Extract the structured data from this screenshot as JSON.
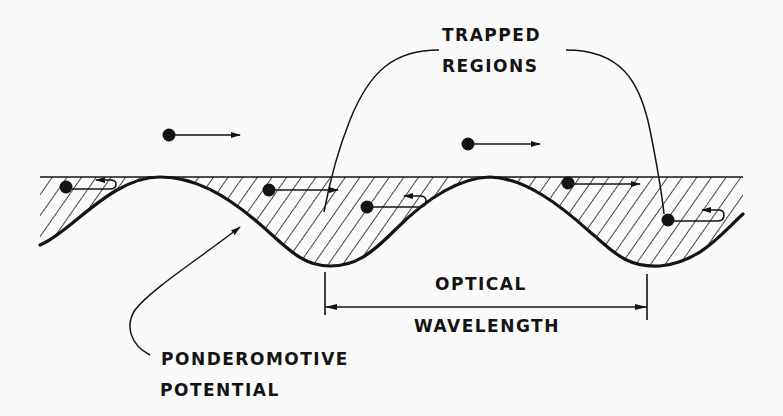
{
  "figure": {
    "labels": {
      "trapped_regions_line1": "TRAPPED",
      "trapped_regions_line2": "REGIONS",
      "optical_wavelength_line1": "OPTICAL",
      "optical_wavelength_line2": "WAVELENGTH",
      "ponderomotive_potential_line1": "PONDEROMOTIVE",
      "ponderomotive_potential_line2": "POTENTIAL"
    },
    "elements": {
      "potential_wave": "ponderomotive potential curve (sinusoidal, two troughs visible)",
      "hatched_region": "region between top boundary and potential curve",
      "free_particles": [
        {
          "position": "above wave, left",
          "direction": "right"
        },
        {
          "position": "above wave, center",
          "direction": "right"
        }
      ],
      "trapped_particles": [
        {
          "position": "left partial well",
          "motion": "oscillating (hook arrow)"
        },
        {
          "position": "first well, top",
          "motion": "right arrow"
        },
        {
          "position": "first well, lower",
          "motion": "oscillating (hook arrow)"
        },
        {
          "position": "second well, top",
          "motion": "right arrow"
        },
        {
          "position": "second well, lower",
          "motion": "oscillating (hook arrow)"
        }
      ],
      "dimension": "one optical wavelength spans trough to trough"
    },
    "colors": {
      "background": "#fafafa",
      "ink": "#141414"
    }
  }
}
